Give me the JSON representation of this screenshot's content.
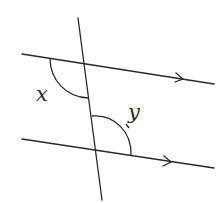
{
  "diagram": {
    "type": "parallel-lines-transversal",
    "colors": {
      "line": "#2a2a2a",
      "background": "#ffffff"
    },
    "labels": {
      "angle_x": "x",
      "angle_y": "y"
    },
    "lines": {
      "parallel_top": {
        "x1": 22,
        "y1": 54,
        "x2": 214,
        "y2": 84
      },
      "parallel_bottom": {
        "x1": 22,
        "y1": 139,
        "x2": 214,
        "y2": 168
      },
      "transversal": {
        "x1": 78,
        "y1": 18,
        "x2": 102,
        "y2": 200
      }
    },
    "parallel_markers": [
      {
        "line": "parallel_top",
        "at": [
          182,
          79
        ],
        "direction": "right"
      },
      {
        "line": "parallel_bottom",
        "at": [
          170,
          162
        ],
        "direction": "right"
      }
    ],
    "angles": [
      {
        "name": "x",
        "location": "top intersection, left of transversal, below top line"
      },
      {
        "name": "y",
        "location": "bottom intersection, right of transversal, above bottom line"
      }
    ]
  }
}
